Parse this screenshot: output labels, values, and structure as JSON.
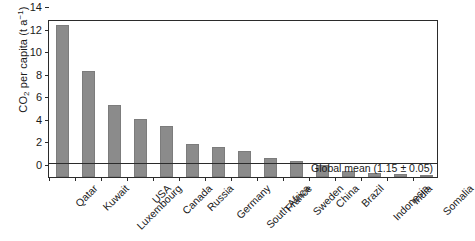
{
  "chart_data": {
    "type": "bar",
    "title": "",
    "xlabel": "",
    "ylabel": "CO2 per capita (t a^-1)",
    "ylabel_parts": {
      "prefix": "CO",
      "sub": "2",
      "middle": " per capita (t a",
      "sup": "−1",
      "suffix": ")"
    },
    "categories": [
      "Qatar",
      "Kuwait",
      "Luxembourg",
      "USA",
      "Canada",
      "Russia",
      "Germany",
      "South Africa",
      "France",
      "Sweden",
      "China",
      "Brazil",
      "Indonesia",
      "India",
      "Somalia"
    ],
    "values": [
      13.5,
      9.35,
      6.35,
      5.15,
      4.55,
      2.95,
      2.65,
      2.3,
      1.7,
      1.45,
      1.1,
      0.5,
      0.35,
      0.3,
      0.12
    ],
    "ylim": [
      0,
      14
    ],
    "yticks": [
      0,
      2,
      4,
      6,
      8,
      10,
      12,
      14
    ],
    "ytick_labels": [
      "0",
      "2",
      "4",
      "6",
      "8",
      "10",
      "12",
      "14"
    ],
    "grid": false,
    "legend": null,
    "annotations": [
      {
        "name": "global-mean",
        "text": "Global mean (1.15 ± 0.05)",
        "value": 1.15,
        "error": 0.05,
        "type": "hline"
      }
    ],
    "bar_color": "#8b8b8b",
    "axis_color": "#2b2b2b"
  }
}
